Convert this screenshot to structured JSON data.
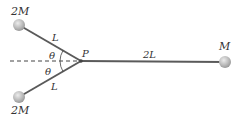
{
  "diagram": {
    "masses": {
      "top_left": "2M",
      "bottom_left": "2M",
      "right": "M"
    },
    "lengths": {
      "upper_rod": "L",
      "lower_rod": "L",
      "right_rod": "2L"
    },
    "angles": {
      "upper": "θ",
      "lower": "θ"
    },
    "point_label": "P",
    "colors": {
      "rod": "#5a5a5a",
      "ball": "#b8b8b8",
      "ball_highlight": "#e4e4e4",
      "dashed_line": "#444444",
      "text": "#333333"
    }
  }
}
